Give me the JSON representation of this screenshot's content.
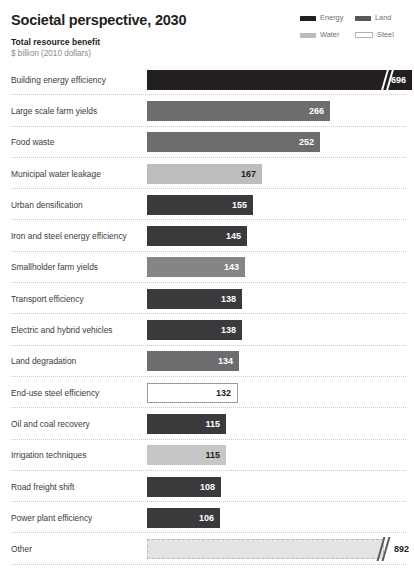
{
  "header": {
    "title": "Societal perspective, 2030",
    "subtitle_main": "Total resource benefit",
    "subtitle_units": "$ billion (2010 dollars)"
  },
  "legend": {
    "items": [
      {
        "label": "Energy",
        "color": "#231f20"
      },
      {
        "label": "Land",
        "color": "#58585a"
      },
      {
        "label": "Water",
        "color": "#bcbcbc"
      },
      {
        "label": "Steel",
        "color": "#ffffff"
      }
    ]
  },
  "chart_data": {
    "type": "bar",
    "orientation": "horizontal",
    "title": "Societal perspective, 2030",
    "subtitle": "Total resource benefit",
    "xlabel": "$ billion (2010 dollars)",
    "ylabel": "",
    "grid": false,
    "legend_position": "top-right",
    "xlim": [
      0,
      300
    ],
    "axis_break": true,
    "series_key": "resource category",
    "categories": [
      "Building energy efficiency",
      "Large scale farm yields",
      "Food waste",
      "Municipal water leakage",
      "Urban densification",
      "Iron and steel energy efficiency",
      "Smallholder farm yields",
      "Transport efficiency",
      "Electric and hybrid vehicles",
      "Land degradation",
      "End-use steel efficiency",
      "Oil and coal recovery",
      "Irrigation techniques",
      "Road freight shift",
      "Power plant efficiency",
      "Other"
    ],
    "values": [
      696,
      266,
      252,
      167,
      155,
      145,
      143,
      138,
      138,
      134,
      132,
      115,
      115,
      108,
      106,
      892
    ],
    "groups": [
      "Energy",
      "Land",
      "Land",
      "Water",
      "Energy",
      "Energy",
      "Land",
      "Energy",
      "Energy",
      "Land",
      "Steel",
      "Energy",
      "Water",
      "Energy",
      "Energy",
      "Other"
    ]
  },
  "rows": [
    {
      "label": "Building energy efficiency",
      "value": "696",
      "group": "Energy",
      "color": "#231f20",
      "text": "light",
      "px": 265,
      "break": true,
      "break_px": 236,
      "value_outside": false,
      "border": "none"
    },
    {
      "label": "Large scale farm yields",
      "value": "266",
      "group": "Land",
      "color": "#6d6d6f",
      "text": "light",
      "px": 183,
      "break": false,
      "break_px": 0,
      "value_outside": false,
      "border": "none"
    },
    {
      "label": "Food waste",
      "value": "252",
      "group": "Land",
      "color": "#6d6d6f",
      "text": "light",
      "px": 173,
      "break": false,
      "break_px": 0,
      "value_outside": false,
      "border": "none"
    },
    {
      "label": "Municipal water leakage",
      "value": "167",
      "group": "Water",
      "color": "#bdbdbd",
      "text": "dark",
      "px": 115,
      "break": false,
      "break_px": 0,
      "value_outside": false,
      "border": "none"
    },
    {
      "label": "Urban densification",
      "value": "155",
      "group": "Energy",
      "color": "#3a3a3c",
      "text": "light",
      "px": 106,
      "break": false,
      "break_px": 0,
      "value_outside": false,
      "border": "none"
    },
    {
      "label": "Iron and steel energy efficiency",
      "value": "145",
      "group": "Energy",
      "color": "#3a3a3c",
      "text": "light",
      "px": 100,
      "break": false,
      "break_px": 0,
      "value_outside": false,
      "border": "none"
    },
    {
      "label": "Smallholder farm yields",
      "value": "143",
      "group": "Land",
      "color": "#858587",
      "text": "light",
      "px": 98,
      "break": false,
      "break_px": 0,
      "value_outside": false,
      "border": "none"
    },
    {
      "label": "Transport efficiency",
      "value": "138",
      "group": "Energy",
      "color": "#3a3a3c",
      "text": "light",
      "px": 95,
      "break": false,
      "break_px": 0,
      "value_outside": false,
      "border": "none"
    },
    {
      "label": "Electric and hybrid vehicles",
      "value": "138",
      "group": "Energy",
      "color": "#3a3a3c",
      "text": "light",
      "px": 95,
      "break": false,
      "break_px": 0,
      "value_outside": false,
      "border": "none"
    },
    {
      "label": "Land degradation",
      "value": "134",
      "group": "Land",
      "color": "#6d6d6f",
      "text": "light",
      "px": 92,
      "break": false,
      "break_px": 0,
      "value_outside": false,
      "border": "none"
    },
    {
      "label": "End-use steel efficiency",
      "value": "132",
      "group": "Steel",
      "color": "#ffffff",
      "text": "dark",
      "px": 91,
      "break": false,
      "break_px": 0,
      "value_outside": false,
      "border": "solid"
    },
    {
      "label": "Oil and coal recovery",
      "value": "115",
      "group": "Energy",
      "color": "#3a3a3c",
      "text": "light",
      "px": 79,
      "break": false,
      "break_px": 0,
      "value_outside": false,
      "border": "none"
    },
    {
      "label": "Irrigation techniques",
      "value": "115",
      "group": "Water",
      "color": "#c6c6c6",
      "text": "dark",
      "px": 79,
      "break": false,
      "break_px": 0,
      "value_outside": false,
      "border": "none"
    },
    {
      "label": "Road freight shift",
      "value": "108",
      "group": "Energy",
      "color": "#3a3a3c",
      "text": "light",
      "px": 74,
      "break": false,
      "break_px": 0,
      "value_outside": false,
      "border": "none"
    },
    {
      "label": "Power plant efficiency",
      "value": "106",
      "group": "Energy",
      "color": "#3a3a3c",
      "text": "light",
      "px": 73,
      "break": false,
      "break_px": 0,
      "value_outside": false,
      "border": "none"
    },
    {
      "label": "Other",
      "value": "892",
      "group": "Other",
      "color": "#e4e4e4",
      "text": "dark",
      "px": 237,
      "break": true,
      "break_px": 232,
      "value_outside": true,
      "border": "dashed"
    }
  ]
}
